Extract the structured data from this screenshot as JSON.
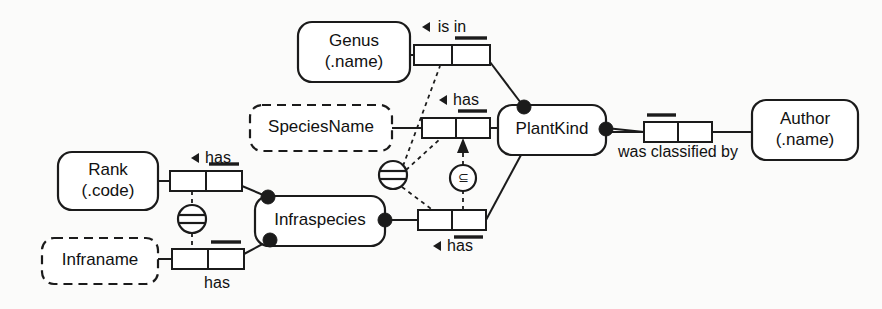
{
  "diagram": {
    "type": "orm-fact-diagram",
    "colors": {
      "stroke": "#1b1b1b",
      "fill": "#ffffff",
      "background": "#fbfbfa",
      "text": "#111111"
    },
    "entities": [
      {
        "id": "genus",
        "label_line1": "Genus",
        "label_line2": "(.name)",
        "kind": "entity-type",
        "border": "solid",
        "x": 298,
        "y": 22,
        "w": 112,
        "h": 60
      },
      {
        "id": "species_name",
        "label_line1": "SpeciesName",
        "label_line2": "",
        "kind": "value-type",
        "border": "dashed",
        "x": 250,
        "y": 105,
        "w": 142,
        "h": 46
      },
      {
        "id": "rank",
        "label_line1": "Rank",
        "label_line2": "(.code)",
        "kind": "entity-type",
        "border": "solid",
        "x": 58,
        "y": 152,
        "w": 100,
        "h": 58
      },
      {
        "id": "infraname",
        "label_line1": "Infraname",
        "label_line2": "",
        "kind": "value-type",
        "border": "dashed",
        "x": 42,
        "y": 238,
        "w": 116,
        "h": 46
      },
      {
        "id": "infraspecies",
        "label_line1": "Infraspecies",
        "label_line2": "",
        "kind": "entity-type",
        "border": "solid",
        "x": 255,
        "y": 196,
        "w": 130,
        "h": 50
      },
      {
        "id": "plantkind",
        "label_line1": "PlantKind",
        "label_line2": "",
        "kind": "entity-type",
        "border": "solid",
        "x": 498,
        "y": 105,
        "w": 108,
        "h": 50
      },
      {
        "id": "author",
        "label_line1": "Author",
        "label_line2": "(.name)",
        "kind": "entity-type",
        "border": "solid",
        "x": 752,
        "y": 100,
        "w": 106,
        "h": 60
      }
    ],
    "fact_types": [
      {
        "id": "is_in",
        "predicate": "is in",
        "arrow": "left",
        "label_x": 452,
        "label_y": 27,
        "box_x": 414,
        "box_y": 45,
        "box_w": 76,
        "box_h": 20,
        "uniqueness": "right-cell-above"
      },
      {
        "id": "plantkind_has_speciesname",
        "predicate": "has",
        "arrow": "left",
        "label_x": 459,
        "label_y": 100,
        "box_x": 422,
        "box_y": 118,
        "box_w": 68,
        "box_h": 20,
        "uniqueness": "right-cell-above"
      },
      {
        "id": "infraspecies_has_plantkind",
        "predicate": "has",
        "arrow": "left",
        "label_x": 452,
        "label_y": 246,
        "box_x": 418,
        "box_y": 210,
        "box_w": 68,
        "box_h": 20,
        "uniqueness": "right-cell-below"
      },
      {
        "id": "rank_has",
        "predicate": "has",
        "arrow": "left",
        "label_x": 211,
        "label_y": 158,
        "box_x": 170,
        "box_y": 171,
        "box_w": 72,
        "box_h": 20,
        "uniqueness": "right-cell-above"
      },
      {
        "id": "infraname_has",
        "predicate": "has",
        "arrow": "none",
        "label_x": 217,
        "label_y": 283,
        "box_x": 172,
        "box_y": 249,
        "box_w": 72,
        "box_h": 20,
        "uniqueness": "right-cell-above"
      },
      {
        "id": "was_classified_by",
        "predicate": "was classified by",
        "arrow": "none",
        "label_x": 678,
        "label_y": 152,
        "box_x": 644,
        "box_y": 122,
        "box_w": 68,
        "box_h": 20,
        "uniqueness": "left-cell-above"
      }
    ],
    "constraints": [
      {
        "id": "equality-left",
        "type": "equality",
        "glyph": "circle-with-bar",
        "cx": 192,
        "cy": 219,
        "r": 14
      },
      {
        "id": "equality-middle",
        "type": "equality",
        "glyph": "circle-with-bar",
        "cx": 393,
        "cy": 175,
        "r": 14
      },
      {
        "id": "subset",
        "type": "subset",
        "glyph": "circle-with-subset-sign",
        "symbol": "⊆",
        "cx": 476,
        "cy": 178,
        "r": 13
      }
    ],
    "mandatory_dots": [
      {
        "id": "infraspecies-top-left",
        "cx": 268,
        "cy": 197
      },
      {
        "id": "infraspecies-bottom-left",
        "cx": 270,
        "cy": 240
      },
      {
        "id": "infraspecies-right",
        "cx": 385,
        "cy": 220
      },
      {
        "id": "plantkind-top-left",
        "cx": 524,
        "cy": 107
      },
      {
        "id": "plantkind-right",
        "cx": 606,
        "cy": 128
      }
    ]
  }
}
